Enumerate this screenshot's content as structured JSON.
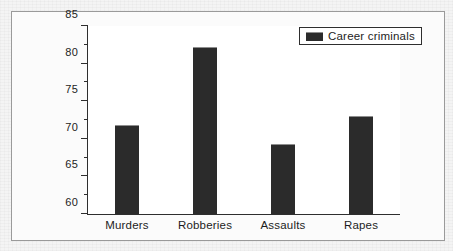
{
  "chart_data": {
    "type": "bar",
    "title": "",
    "xlabel": "",
    "ylabel": "",
    "categories": [
      "Murders",
      "Robberies",
      "Assaults",
      "Rapes"
    ],
    "values": [
      71.8,
      82.2,
      69.3,
      73.0
    ],
    "series": [
      {
        "name": "Career criminals",
        "values": [
          71.8,
          82.2,
          69.3,
          73.0
        ],
        "color": "#2b2b2b"
      }
    ],
    "ylim": [
      60,
      85
    ],
    "ytick_values": [
      60,
      65,
      70,
      75,
      80,
      85
    ],
    "ytick_labels": [
      "60",
      "65",
      "70",
      "75",
      "80",
      "85"
    ],
    "yminor_tick_values": [
      62.5,
      67.5,
      72.5,
      77.5,
      82.5
    ],
    "grid": false,
    "legend": {
      "position": "top-right",
      "entries": [
        {
          "label": "Career criminals",
          "swatch_name": "legend-swatch-career-criminals",
          "color": "#2b2b2b"
        }
      ]
    },
    "colors": {
      "bar": "#2b2b2b",
      "bar_highlight": "#8e8e8e",
      "axis": "#2e2e2e",
      "plot_background": "#ffffff",
      "figure_background": "#fbfbfb",
      "page_background": "#f4f4f4",
      "frame_border": "#9a9a9a",
      "text": "#1d1d1d"
    }
  }
}
